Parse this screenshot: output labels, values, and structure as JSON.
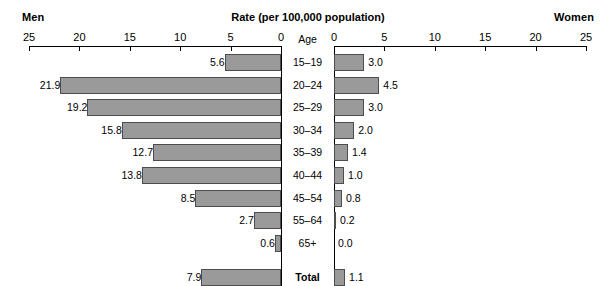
{
  "header": {
    "left_label": "Men",
    "right_label": "Women",
    "title": "Rate (per 100,000 population)",
    "age_column_header": "Age"
  },
  "axis": {
    "tick_labels_left": [
      "25",
      "20",
      "15",
      "10",
      "5",
      "0"
    ],
    "tick_labels_right": [
      "0",
      "5",
      "10",
      "15",
      "20",
      "25"
    ],
    "max": 25,
    "min": 0
  },
  "chart_data": {
    "type": "bar",
    "subtype": "population-pyramid",
    "title": "Rate (per 100,000 population)",
    "xlabel": "Rate (per 100,000 population)",
    "ylabel": "Age",
    "xlim": [
      0,
      25
    ],
    "grid": false,
    "orientation": "horizontal",
    "categories": [
      "15–19",
      "20–24",
      "25–29",
      "30–34",
      "35–39",
      "40–44",
      "45–54",
      "55–64",
      "65+",
      "Total"
    ],
    "series": [
      {
        "name": "Men",
        "side": "left",
        "values": [
          5.6,
          21.9,
          19.2,
          15.8,
          12.7,
          13.8,
          8.5,
          2.7,
          0.6,
          7.9
        ]
      },
      {
        "name": "Women",
        "side": "right",
        "values": [
          3.0,
          4.5,
          3.0,
          2.0,
          1.4,
          1.0,
          0.8,
          0.2,
          0.0,
          1.1
        ]
      }
    ],
    "value_labels": {
      "men": [
        "5.6",
        "21.9",
        "19.2",
        "15.8",
        "12.7",
        "13.8",
        "8.5",
        "2.7",
        "0.6",
        "7.9"
      ],
      "women": [
        "3.0",
        "4.5",
        "3.0",
        "2.0",
        "1.4",
        "1.0",
        "0.8",
        "0.2",
        "0.0",
        "1.1"
      ]
    },
    "colors": {
      "bar_fill": "#9a9a9a",
      "bar_stroke": "#4d4d4d",
      "axis": "#000000",
      "background": "#ffffff"
    }
  }
}
